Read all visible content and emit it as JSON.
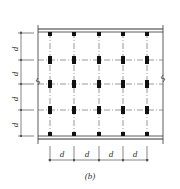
{
  "diagram": {
    "caption": "(b)",
    "spacing_label": "d",
    "vertical_dim_labels": [
      "d",
      "d",
      "d",
      "d"
    ],
    "horizontal_dim_labels": [
      "d",
      "d",
      "d",
      "d"
    ],
    "columns_x": [
      50,
      74,
      99,
      123,
      147
    ],
    "rows_y": [
      33,
      60,
      84,
      110,
      134
    ],
    "colors": {
      "line": "#333333",
      "fill": "#111111",
      "background": "#ffffff"
    }
  }
}
